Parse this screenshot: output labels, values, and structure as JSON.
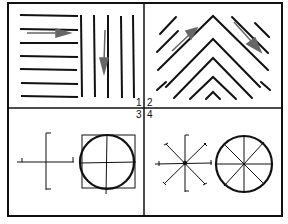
{
  "figure": {
    "panels": [
      {
        "id": "1",
        "label": "1",
        "description": "horizontal-and-vertical-line-texture"
      },
      {
        "id": "2",
        "label": "2",
        "description": "chevron-diagonal-line-texture"
      },
      {
        "id": "3",
        "label": "3",
        "description": "cross-axes-and-circle-in-square"
      },
      {
        "id": "4",
        "label": "4",
        "description": "eight-spoke-star-and-divided-circle"
      }
    ],
    "colors": {
      "ink": "#111111",
      "arrow": "#666666",
      "background": "#ffffff"
    }
  }
}
